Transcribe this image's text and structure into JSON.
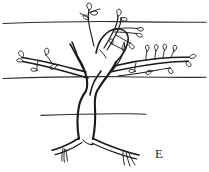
{
  "figure": {
    "caption_letter": "E",
    "style": "pen-and-ink line drawing",
    "background_color": "#ffffff",
    "ink_color": "#1a1a1a",
    "wire_color": "#2b2b2b",
    "canvas": {
      "width": 209,
      "height": 172
    }
  },
  "label": {
    "text": "E",
    "x": 155,
    "y": 147,
    "font_size": 13,
    "color": "#2b2b2b"
  },
  "scene": {
    "horizontal_lines": [
      {
        "name": "wire-top",
        "y": 22,
        "x_start": 2,
        "x_end": 207
      },
      {
        "name": "wire-middle",
        "y": 77,
        "x_start": 2,
        "x_end": 207
      },
      {
        "name": "wire-bottom",
        "y": 114,
        "x_start": 40,
        "x_end": 146
      }
    ],
    "trunk": {
      "name": "forked-trunk",
      "base_y": 140,
      "fork_y": 92,
      "left_limb_tip": [
        74,
        55
      ],
      "right_limb_tip": [
        118,
        62
      ]
    },
    "roots": {
      "name": "root-flare",
      "count": 4,
      "spread_x": [
        58,
        152
      ],
      "ground_y": 140
    },
    "branches": [
      {
        "name": "branch-upper-left",
        "leaves": 3
      },
      {
        "name": "branch-upper-right",
        "leaves": 5
      },
      {
        "name": "branch-left",
        "leaves": 3
      },
      {
        "name": "branch-right",
        "leaves": 8
      },
      {
        "name": "branch-center",
        "leaves": 2
      }
    ],
    "leaf_count_total": 21
  }
}
